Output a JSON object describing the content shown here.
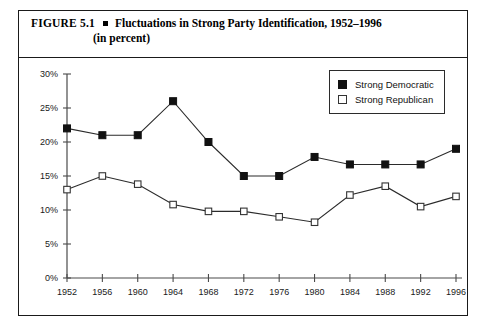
{
  "figure": {
    "label": "FIGURE 5.1",
    "bullet_icon": "square-bullet",
    "title_line_1": "Fluctuations in Strong Party Identification, 1952–1996",
    "title_line_2": "(in percent)"
  },
  "legend": {
    "position": "top-right-inside",
    "entries": [
      {
        "label": "Strong Democratic",
        "marker": "filled-square",
        "color": "#111111"
      },
      {
        "label": "Strong Republican",
        "marker": "open-square",
        "color": "#ffffff"
      }
    ]
  },
  "chart_data": {
    "type": "line",
    "title": "Fluctuations in Strong Party Identification, 1952–1996 (in percent)",
    "xlabel": "",
    "ylabel": "",
    "x": [
      1952,
      1956,
      1960,
      1964,
      1968,
      1972,
      1976,
      1980,
      1984,
      1988,
      1992,
      1996
    ],
    "categories": [
      "1952",
      "1956",
      "1960",
      "1964",
      "1968",
      "1972",
      "1976",
      "1980",
      "1984",
      "1988",
      "1992",
      "1996"
    ],
    "series": [
      {
        "name": "Strong Democratic",
        "marker": "filled-square",
        "values": [
          22,
          21,
          21,
          26,
          20,
          15,
          15,
          17.8,
          16.7,
          16.7,
          16.7,
          19
        ]
      },
      {
        "name": "Strong Republican",
        "marker": "open-square",
        "values": [
          13,
          15,
          13.8,
          10.8,
          9.8,
          9.8,
          9,
          8.2,
          12.2,
          13.5,
          10.5,
          12
        ]
      }
    ],
    "ylim": [
      0,
      30
    ],
    "yticks": [
      0,
      5,
      10,
      15,
      20,
      25,
      30
    ],
    "ytick_labels": [
      "0%",
      "5%",
      "10%",
      "15%",
      "20%",
      "25%",
      "30%"
    ],
    "grid": false,
    "legend_position": "upper right"
  }
}
